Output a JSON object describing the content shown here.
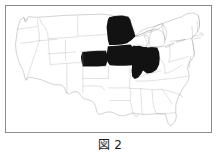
{
  "figure": {
    "caption": "図 2",
    "frame_border_color": "#8c8c8c",
    "background_color": "#ffffff"
  },
  "map": {
    "name": "united-states-map",
    "title": "",
    "outline_color": "#5a5a5a",
    "state_border_color": "#9a9a9a",
    "highlight_color": "#121212",
    "plain_state_color": "#ffffff",
    "highlighted_states": [
      "Minnesota",
      "Iowa",
      "Nebraska",
      "Illinois",
      "Indiana"
    ],
    "plain_states": [
      "Washington",
      "Oregon",
      "California",
      "Idaho",
      "Nevada",
      "Utah",
      "Arizona",
      "Montana",
      "Wyoming",
      "Colorado",
      "New Mexico",
      "North Dakota",
      "South Dakota",
      "Kansas",
      "Oklahoma",
      "Texas",
      "Wisconsin",
      "Michigan",
      "Missouri",
      "Arkansas",
      "Louisiana",
      "Mississippi",
      "Alabama",
      "Tennessee",
      "Kentucky",
      "Ohio",
      "West Virginia",
      "Virginia",
      "North Carolina",
      "South Carolina",
      "Georgia",
      "Florida",
      "Pennsylvania",
      "New York",
      "Maine",
      "Vermont",
      "New Hampshire",
      "Massachusetts",
      "Connecticut",
      "Rhode Island",
      "New Jersey",
      "Delaware",
      "Maryland"
    ]
  }
}
